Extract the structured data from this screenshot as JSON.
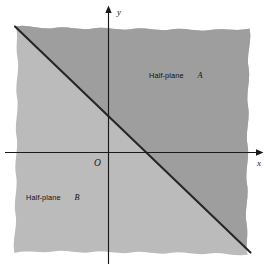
{
  "figure": {
    "type": "math-diagram",
    "axes": {
      "x_axis_label": "x",
      "y_axis_label": "y",
      "origin_label": "O"
    },
    "regions": [
      {
        "id": "half-plane-a",
        "label_text": "Half-plane",
        "label_name": "A",
        "position": "upper-right",
        "fill_color": "#9b9b9b"
      },
      {
        "id": "half-plane-b",
        "label_text": "Half-plane",
        "label_name": "B",
        "position": "lower-left",
        "fill_color": "#b9b9b9"
      }
    ],
    "boundary_line": {
      "description": "diagonal boundary line with negative slope",
      "color": "#262626"
    },
    "colors": {
      "background": "#ffffff",
      "axis": "#1a1a1a",
      "half_plane_a_fill": "#9b9b9b",
      "half_plane_b_fill": "#b9b9b9",
      "boundary_line": "#262626"
    }
  }
}
